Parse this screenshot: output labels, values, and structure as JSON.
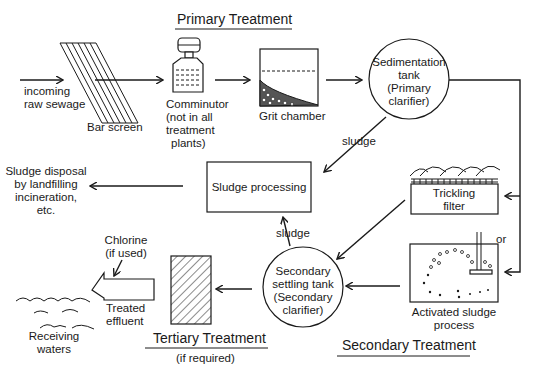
{
  "diagram": {
    "title_primary": "Primary Treatment",
    "title_secondary": "Secondary Treatment",
    "title_tertiary": "Tertiary Treatment",
    "tertiary_note": "(if required)",
    "nodes": {
      "incoming": [
        "incoming",
        "raw sewage"
      ],
      "bar_screen": "Bar screen",
      "comminutor": [
        "Comminutor",
        "(not in all",
        "treatment",
        "plants)"
      ],
      "grit_chamber": "Grit chamber",
      "sedimentation": [
        "Sedimentation",
        "tank",
        "(Primary",
        "clarifier)"
      ],
      "sludge_processing": "Sludge processing",
      "sludge_disposal": [
        "Sludge disposal",
        "by landfilling",
        "incineration,",
        "etc."
      ],
      "trickling_filter": [
        "Trickling",
        "filter"
      ],
      "or_label": "or",
      "activated_sludge": [
        "Activated sludge",
        "process"
      ],
      "secondary_settling": [
        "Secondary",
        "settling tank",
        "(Secondary",
        "clarifier)"
      ],
      "chlorine": [
        "Chlorine",
        "(if used)"
      ],
      "treated_effluent": [
        "Treated",
        "effluent"
      ],
      "receiving_waters": [
        "Receiving",
        "waters"
      ]
    },
    "edge_labels": {
      "sludge_primary": "sludge",
      "sludge_secondary": "sludge"
    },
    "edges": [
      [
        "incoming",
        "bar_screen"
      ],
      [
        "bar_screen",
        "comminutor"
      ],
      [
        "comminutor",
        "grit_chamber"
      ],
      [
        "grit_chamber",
        "sedimentation"
      ],
      [
        "sedimentation",
        "trickling_filter"
      ],
      [
        "sedimentation",
        "activated_sludge"
      ],
      [
        "sedimentation",
        "sludge_processing",
        "sludge"
      ],
      [
        "trickling_filter",
        "secondary_settling"
      ],
      [
        "activated_sludge",
        "secondary_settling"
      ],
      [
        "secondary_settling",
        "sludge_processing",
        "sludge"
      ],
      [
        "sludge_processing",
        "sludge_disposal"
      ],
      [
        "secondary_settling",
        "tertiary"
      ],
      [
        "tertiary",
        "treated_effluent"
      ],
      [
        "chlorine",
        "treated_effluent"
      ],
      [
        "treated_effluent",
        "receiving_waters"
      ]
    ]
  }
}
